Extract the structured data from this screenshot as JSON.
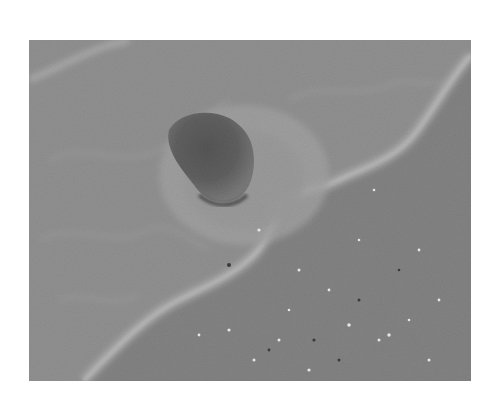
{
  "image": {
    "description": "Black-and-white photograph of a dark rock on a sandy beach, with foamy wave water edge crossing diagonally from bottom-left to top-right",
    "subject": "rock on beach sand at wave edge",
    "colors": {
      "background": "#ffffff",
      "wet_sand": "#9a9a9a",
      "dry_sand": "#7c7c7c",
      "foam": "#d8d8d8",
      "rock": "#2e2e2e"
    }
  }
}
